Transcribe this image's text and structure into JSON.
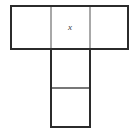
{
  "figure": {
    "kind": "polyomino-net",
    "canvas": {
      "width": 135,
      "height": 133
    },
    "colors": {
      "background": "#ffffff",
      "outline": "#2b2b2b",
      "interior_divider": "#6e6e6e"
    },
    "stroke": {
      "outline_width": 2.0,
      "divider_width": 1.2
    },
    "geometry": {
      "top_row": {
        "left": 11,
        "top": 6,
        "right": 128,
        "bottom": 49
      },
      "stem": {
        "left": 51,
        "top": 49,
        "right": 90,
        "bottom": 127
      },
      "vertical_dividers_x": [
        51,
        90
      ],
      "stem_divider_y": 88,
      "square_count": 5
    },
    "labels": [
      {
        "text": "x",
        "x": 70,
        "y": 27,
        "cell": "top-middle"
      }
    ]
  }
}
